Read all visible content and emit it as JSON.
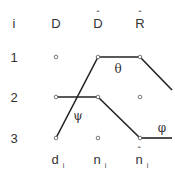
{
  "header": {
    "index_label": "i",
    "columns": [
      "D",
      "D",
      "R"
    ],
    "column_hats": [
      false,
      true,
      true
    ]
  },
  "rows": [
    "1",
    "2",
    "3"
  ],
  "footer": {
    "labels": [
      {
        "base": "d",
        "sub": "i",
        "hat": false
      },
      {
        "base": "n",
        "sub": "i",
        "hat": false
      },
      {
        "base": "n",
        "sub": "i",
        "hat": true
      }
    ]
  },
  "angle_labels": {
    "theta": "θ",
    "psi": "ψ",
    "phi": "φ"
  },
  "colors": {
    "line": "#222222",
    "text": "#333333",
    "node": "#555555"
  },
  "graph": {
    "nodes": [
      {
        "id": "D1",
        "x": 56,
        "y": 57
      },
      {
        "id": "Dh1",
        "x": 98,
        "y": 57
      },
      {
        "id": "Rh1",
        "x": 140,
        "y": 57
      },
      {
        "id": "D2",
        "x": 56,
        "y": 97
      },
      {
        "id": "Dh2",
        "x": 98,
        "y": 97
      },
      {
        "id": "Rh2",
        "x": 140,
        "y": 97
      },
      {
        "id": "D3",
        "x": 56,
        "y": 138
      },
      {
        "id": "Dh3",
        "x": 98,
        "y": 138
      },
      {
        "id": "Rh3",
        "x": 140,
        "y": 138
      }
    ],
    "edges": [
      {
        "from": "D3",
        "to": "Dh1"
      },
      {
        "from": "Dh1",
        "to": "Rh1"
      },
      {
        "from": "Rh1",
        "to": "offscreen-right-2"
      },
      {
        "from": "D2",
        "to": "Dh2"
      },
      {
        "from": "Dh2",
        "to": "Rh3"
      },
      {
        "from": "Rh3",
        "to": "offscreen-right-3"
      }
    ]
  }
}
